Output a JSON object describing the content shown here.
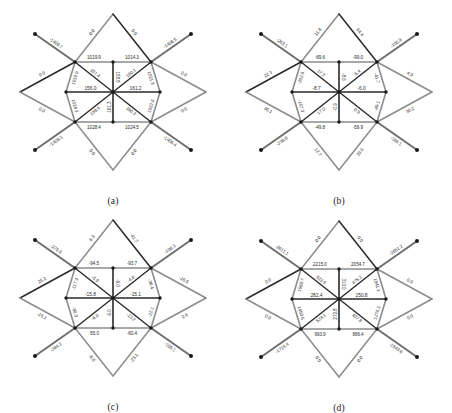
{
  "figure": {
    "type": "four-panel structural lattice diagram",
    "panel_count": 4,
    "colors": {
      "member_gray": "#8c8c8c",
      "member_dark": "#2a2a2a",
      "member_mid": "#6e6e6e",
      "label_text": "#2b2b2b",
      "background": "#ffffff",
      "node_dot": "#1a1a1a"
    }
  },
  "panels": [
    {
      "id": "a",
      "caption": "(a)",
      "labels": {
        "outer_top_left": "0.0",
        "outer_top_right": "0.0",
        "outer_bottom_left": "0.0",
        "outer_bottom_right": "0.0",
        "outer_left_upper": "0.0",
        "outer_left_lower": "0.0",
        "outer_right_upper": "0.0",
        "outer_right_lower": "0.0",
        "diag_top_left": "-1409.7",
        "diag_top_right": "-1406.5",
        "diag_bottom_left": "-1409.1",
        "diag_bottom_right": "-1406.4",
        "ring_top_left": "1019.9",
        "ring_top_right": "1014.3",
        "ring_bottom_left": "1028.4",
        "ring_bottom_right": "1024.5",
        "ring_left_upper": "1016.9",
        "ring_left_lower": "1024.2",
        "ring_right_upper": "1021.3",
        "ring_right_lower": "1022.6",
        "brace_tl": "157.4",
        "brace_tr": "160.1",
        "brace_bl": "159.4",
        "brace_br": "160.3",
        "spoke_top": "158.8",
        "spoke_bottom": "161.3",
        "center_left": "156.0",
        "center_right": "161.2"
      }
    },
    {
      "id": "b",
      "caption": "(b)",
      "labels": {
        "outer_top_left": "11.8",
        "outer_top_right": "64.4",
        "outer_bottom_left": "12.7",
        "outer_bottom_right": "29.9",
        "outer_left_upper": "22.3",
        "outer_left_lower": "36.1",
        "outer_right_upper": "4.9",
        "outer_right_lower": "30.2",
        "diag_top_left": "-263.1",
        "diag_top_right": "-100.9",
        "diag_bottom_left": "-238.6",
        "diag_bottom_right": "-166.1",
        "ring_top_left": "-89.6",
        "ring_top_right": "-99.0",
        "ring_bottom_left": "-49.8",
        "ring_bottom_right": "-59.9",
        "ring_left_upper": "-202.8",
        "ring_left_lower": "-107.3",
        "ring_right_upper": "-41.7",
        "ring_right_lower": "-49.1",
        "brace_tl": "17.3",
        "brace_tr": "-5.4",
        "brace_bl": "17.0",
        "brace_br": "0.9",
        "spoke_top": "-8.6",
        "spoke_bottom": "-0.9",
        "center_left": "-8.7",
        "center_right": "-6.0"
      }
    },
    {
      "id": "c",
      "caption": "(c)",
      "labels": {
        "outer_top_left": "6.3",
        "outer_top_right": "-41.7",
        "outer_bottom_left": "-9.8",
        "outer_bottom_right": "-23.1",
        "outer_left_upper": "25.2",
        "outer_left_lower": "-15.1",
        "outer_right_upper": "-16.6",
        "outer_right_lower": "-2.6",
        "diag_top_left": "-275.9",
        "diag_top_right": "-106.3",
        "diag_bottom_left": "-264.2",
        "diag_bottom_right": "-105.1",
        "ring_top_left": "-94.5",
        "ring_top_right": "-93.7",
        "ring_bottom_left": "-55.0",
        "ring_bottom_right": "-60.4",
        "ring_left_upper": "-117.4",
        "ring_left_lower": "-80.3",
        "ring_right_upper": "-36.4",
        "ring_right_lower": "-22.1",
        "brace_tl": "-5.9",
        "brace_tr": "-4.6",
        "brace_bl": "-6.0",
        "brace_br": "-13.2",
        "spoke_top": "-9.0",
        "spoke_bottom": "-9.0",
        "center_left": "-15.8",
        "center_right": "-15.1"
      }
    },
    {
      "id": "d",
      "caption": "(d)",
      "labels": {
        "outer_top_left": "0.0",
        "outer_top_right": "0.0",
        "outer_bottom_left": "0.0",
        "outer_bottom_right": "0.0",
        "outer_left_upper": "0.0",
        "outer_left_lower": "0.0",
        "outer_right_upper": "0.0",
        "outer_right_lower": "0.0",
        "diag_top_left": "-2611.1",
        "diag_top_right": "-2651.2",
        "diag_bottom_left": "-1724.4",
        "diag_bottom_right": "-1543.6",
        "ring_top_left": "2215.0",
        "ring_top_right": "2054.7",
        "ring_bottom_left": "993.9",
        "ring_bottom_right": "886.4",
        "ring_left_upper": "1988.7",
        "ring_left_lower": "1453.6",
        "ring_right_upper": "1841.1",
        "ring_right_lower": "1278.3",
        "brace_tl": "533.5",
        "brace_tr": "475.2",
        "brace_bl": "524.1",
        "brace_br": "437.8",
        "spoke_top": "310.0",
        "spoke_bottom": "272.8",
        "center_left": "282.4",
        "center_right": "250.8"
      }
    }
  ]
}
